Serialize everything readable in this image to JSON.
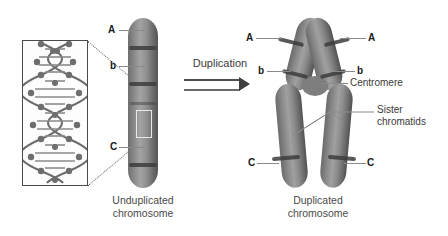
{
  "figure": {
    "background_color": "#ffffff",
    "chromosome_color": "#8a8a8a",
    "band_color": "#3c3c3c",
    "leader_color": "#8a8a8a",
    "text_color": "#3a3a3a"
  },
  "inset": {
    "name": "dna-double-helix",
    "description": "DNA double helix"
  },
  "process_arrow": {
    "label": "Duplication",
    "direction": "right"
  },
  "left_panel": {
    "caption": "Unduplicated\nchromosome",
    "labels": [
      {
        "text": "A",
        "id": "gene-a"
      },
      {
        "text": "b",
        "id": "gene-b"
      },
      {
        "text": "C",
        "id": "gene-c"
      }
    ]
  },
  "right_panel": {
    "caption": "Duplicated\nchromosome",
    "labels_left": [
      {
        "text": "A",
        "id": "gene-a-left"
      },
      {
        "text": "b",
        "id": "gene-b-left"
      },
      {
        "text": "C",
        "id": "gene-c-left"
      }
    ],
    "labels_right": [
      {
        "text": "A",
        "id": "gene-a-right"
      },
      {
        "text": "b",
        "id": "gene-b-right"
      },
      {
        "text": "C",
        "id": "gene-c-right"
      }
    ],
    "annotations": [
      {
        "text": "Centromere",
        "id": "centromere"
      },
      {
        "text": "Sister\nchromatids",
        "id": "sister-chromatids"
      }
    ]
  }
}
